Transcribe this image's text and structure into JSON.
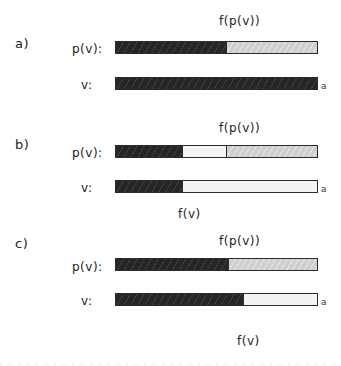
{
  "colors": {
    "dark": "#262626",
    "gray": "#cfcfcf",
    "white": "#f3f3f3",
    "outline": "#2a2a2a"
  },
  "panels": [
    {
      "label": "a)",
      "top_annotation": "f(p(v))",
      "bottom_annotation": "",
      "rows": [
        {
          "label": "p(v):",
          "end_marker": "",
          "segments": [
            {
              "fill": "dark",
              "width": 110
            },
            {
              "fill": "gray",
              "width": 93
            }
          ]
        },
        {
          "label": "v:",
          "end_marker": "a",
          "segments": [
            {
              "fill": "dark",
              "width": 203
            }
          ]
        }
      ]
    },
    {
      "label": "b)",
      "top_annotation": "f(p(v))",
      "bottom_annotation": "f(v)",
      "rows": [
        {
          "label": "p(v):",
          "end_marker": "",
          "segments": [
            {
              "fill": "dark",
              "width": 66
            },
            {
              "fill": "white",
              "width": 44
            },
            {
              "fill": "gray",
              "width": 93
            }
          ]
        },
        {
          "label": "v:",
          "end_marker": "a",
          "segments": [
            {
              "fill": "dark",
              "width": 66
            },
            {
              "fill": "white",
              "width": 137
            }
          ]
        }
      ]
    },
    {
      "label": "c)",
      "top_annotation": "f(p(v))",
      "bottom_annotation": "f(v)",
      "rows": [
        {
          "label": "p(v):",
          "end_marker": "",
          "segments": [
            {
              "fill": "dark",
              "width": 112
            },
            {
              "fill": "gray",
              "width": 91
            }
          ]
        },
        {
          "label": "v:",
          "end_marker": "a",
          "segments": [
            {
              "fill": "dark",
              "width": 127
            },
            {
              "fill": "white",
              "width": 76
            }
          ]
        }
      ]
    }
  ]
}
